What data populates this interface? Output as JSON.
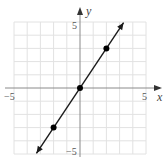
{
  "chart_data": {
    "type": "line",
    "title": "",
    "xlabel": "x",
    "ylabel": "y",
    "xlim": [
      -5,
      5
    ],
    "ylim": [
      -5,
      5
    ],
    "grid": true,
    "grid_step": 1,
    "x_tick_labels": [
      "-5",
      "5"
    ],
    "y_tick_labels": [
      "5",
      "-5"
    ],
    "line": {
      "equation": "y = 1.5x",
      "slope": 1.5,
      "intercept": 0,
      "arrows_both_ends": true
    },
    "points": [
      {
        "x": -2,
        "y": -3
      },
      {
        "x": 0,
        "y": 0
      },
      {
        "x": 2,
        "y": 3
      }
    ]
  },
  "labels": {
    "x_axis": "x",
    "y_axis": "y",
    "x_min": "−5",
    "x_max": "5",
    "y_max": "5",
    "y_min": "−5"
  },
  "colors": {
    "grid": "#e2e2e2",
    "axis": "#8a8a8a",
    "line": "#1a1a1a",
    "point": "#000000"
  }
}
